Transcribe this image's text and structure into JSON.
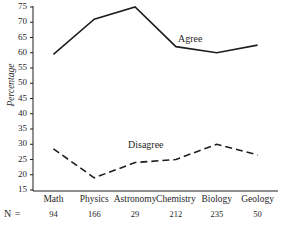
{
  "chart_data": {
    "type": "line",
    "title": "",
    "xlabel": "",
    "ylabel": "Percentage",
    "ylim": [
      15,
      75
    ],
    "yticks": [
      15,
      20,
      25,
      30,
      35,
      40,
      45,
      50,
      55,
      60,
      65,
      70,
      75
    ],
    "grid": false,
    "legend_position": "inline-annotation",
    "categories": [
      "Math",
      "Physics",
      "Astronomy",
      "Chemistry",
      "Biology",
      "Geology"
    ],
    "series": [
      {
        "name": "Agree",
        "style": "solid",
        "color": "#1f1f1f",
        "values": [
          59.5,
          71,
          75,
          62,
          60,
          62.5
        ]
      },
      {
        "name": "Disagree",
        "style": "dashed",
        "color": "#1f1f1f",
        "values": [
          28.5,
          19,
          24,
          25,
          30,
          26.5
        ]
      }
    ],
    "annotations": [
      {
        "text": "Agree",
        "series": "Agree"
      },
      {
        "text": "Disagree",
        "series": "Disagree"
      }
    ],
    "sample_sizes": {
      "label": "N =",
      "values": [
        "94",
        "166",
        "29",
        "212",
        "235",
        "50"
      ]
    }
  },
  "axis": {
    "y_tick_labels": [
      "75",
      "70",
      "65",
      "60",
      "55",
      "50",
      "45",
      "40",
      "35",
      "30",
      "25",
      "20",
      "15"
    ],
    "x_tick_labels": [
      "Math",
      "Physics",
      "Astronomy",
      "Chemistry",
      "Biology",
      "Geology"
    ],
    "y_title": "Percentage"
  }
}
